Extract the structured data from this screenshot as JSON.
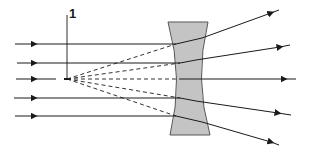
{
  "diagram": {
    "type": "optics-ray-diagram",
    "labels": [
      {
        "id": "focal-point-label",
        "text": "1",
        "x": 68,
        "y": 8
      }
    ],
    "colors": {
      "line": "#1a1a1a",
      "lens_fill": "#c4c4c4",
      "lens_stroke": "#555555",
      "background": "#ffffff"
    },
    "focal_point": {
      "x": 67,
      "y": 79
    },
    "lens": {
      "top_left": [
        168,
        22
      ],
      "top_right": [
        208,
        22
      ],
      "bottom_left": [
        170,
        135
      ],
      "bottom_right": [
        210,
        135
      ],
      "waist_left": [
        180,
        79
      ],
      "waist_right": [
        198,
        79
      ]
    },
    "rays": [
      {
        "name": "ray-1",
        "in_y": 44,
        "hit": [
          176,
          44
        ],
        "exit": [
          202,
          38
        ],
        "end": [
          279,
          10
        ]
      },
      {
        "name": "ray-2",
        "in_y": 63,
        "hit": [
          180,
          63
        ],
        "exit": [
          196,
          60
        ],
        "end": [
          290,
          45
        ]
      },
      {
        "name": "ray-3",
        "in_y": 79,
        "hit": [
          180,
          79
        ],
        "exit": [
          198,
          79
        ],
        "end": [
          296,
          79
        ]
      },
      {
        "name": "ray-4",
        "in_y": 98,
        "hit": [
          180,
          98
        ],
        "exit": [
          196,
          101
        ],
        "end": [
          291,
          115
        ]
      },
      {
        "name": "ray-5",
        "in_y": 116,
        "hit": [
          176,
          116
        ],
        "exit": [
          202,
          122
        ],
        "end": [
          279,
          145
        ]
      }
    ],
    "incoming_start_x": 15,
    "incoming_arrow_x": 34
  }
}
